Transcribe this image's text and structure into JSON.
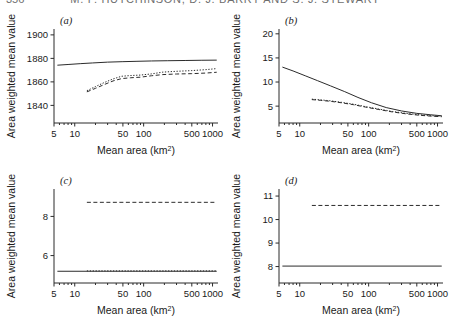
{
  "header": {
    "folio": "356",
    "running_title": "M. F. HUTCHINSON, D. J. BARRY AND S. J. STEWART"
  },
  "axis_titles": {
    "x": "Mean area (km",
    "x_sup": "2",
    "x_close": ")",
    "y": "Area weighted mean value"
  },
  "chart_data": [
    {
      "type": "line",
      "panel": "a",
      "label": "(a)",
      "title": "",
      "xlabel": "Mean area (km2)",
      "ylabel": "Area weighted mean value",
      "xscale": "log",
      "xlim": [
        5,
        1200
      ],
      "ylim": [
        1825,
        1905
      ],
      "xticks": [
        5,
        10,
        50,
        100,
        500,
        1000
      ],
      "xticklabels": [
        "5",
        "10",
        "50",
        "100",
        "500",
        "1000"
      ],
      "yticks": [
        1840,
        1860,
        1880,
        1900
      ],
      "yticklabels": [
        "1840",
        "1860",
        "1880",
        "1900"
      ],
      "grid": false,
      "legend": "none",
      "series": [
        {
          "name": "solid-upper",
          "style": "solid",
          "x": [
            5.6,
            8,
            12,
            18,
            30,
            50,
            80,
            130,
            220,
            400,
            700,
            1150
          ],
          "values": [
            1874.2,
            1874.8,
            1875.5,
            1876.1,
            1876.8,
            1877.2,
            1877.5,
            1877.8,
            1878.0,
            1878.2,
            1878.4,
            1878.5
          ]
        },
        {
          "name": "dotted-middle",
          "style": "dotted",
          "x": [
            15,
            20,
            27,
            36,
            48,
            65,
            90,
            130,
            190,
            300,
            500,
            800,
            1150
          ],
          "values": [
            1852.5,
            1856.0,
            1859.5,
            1862.5,
            1864.8,
            1865.4,
            1865.8,
            1866.8,
            1868.3,
            1869.0,
            1869.6,
            1870.4,
            1871.3
          ]
        },
        {
          "name": "dashed-lower",
          "style": "dashed",
          "x": [
            15,
            20,
            27,
            36,
            48,
            65,
            90,
            130,
            190,
            300,
            500,
            800,
            1150
          ],
          "values": [
            1851.5,
            1854.5,
            1857.8,
            1860.8,
            1862.8,
            1863.5,
            1864.0,
            1865.2,
            1866.2,
            1866.7,
            1867.0,
            1867.5,
            1868.2
          ]
        }
      ]
    },
    {
      "type": "line",
      "panel": "b",
      "label": "(b)",
      "title": "",
      "xlabel": "Mean area (km2)",
      "ylabel": "Area weighted mean value",
      "xscale": "log",
      "xlim": [
        5,
        1200
      ],
      "ylim": [
        1.5,
        21
      ],
      "xticks": [
        5,
        10,
        50,
        100,
        500,
        1000
      ],
      "xticklabels": [
        "5",
        "10",
        "50",
        "100",
        "500",
        "1000"
      ],
      "yticks": [
        5,
        10,
        15,
        20
      ],
      "yticklabels": [
        "5",
        "10",
        "15",
        "20"
      ],
      "grid": false,
      "legend": "none",
      "series": [
        {
          "name": "solid-upper",
          "style": "solid",
          "x": [
            5.6,
            8,
            12,
            18,
            28,
            45,
            70,
            110,
            180,
            300,
            500,
            800,
            1150
          ],
          "values": [
            13.1,
            12.3,
            11.3,
            10.3,
            9.2,
            8.0,
            6.8,
            5.7,
            4.7,
            4.0,
            3.5,
            3.2,
            3.0
          ]
        },
        {
          "name": "dashed-lower",
          "style": "dashed",
          "x": [
            15,
            20,
            28,
            40,
            60,
            90,
            140,
            220,
            350,
            550,
            850,
            1150
          ],
          "values": [
            6.35,
            6.2,
            6.0,
            5.7,
            5.3,
            4.8,
            4.3,
            3.8,
            3.4,
            3.1,
            2.9,
            2.8
          ]
        },
        {
          "name": "dotted-lower",
          "style": "dotted",
          "x": [
            15,
            20,
            28,
            40,
            60,
            90,
            140,
            220,
            350,
            550,
            850,
            1150
          ],
          "values": [
            6.45,
            6.3,
            6.1,
            5.8,
            5.4,
            4.9,
            4.4,
            3.9,
            3.5,
            3.2,
            3.0,
            2.9
          ]
        }
      ]
    },
    {
      "type": "line",
      "panel": "c",
      "label": "(c)",
      "title": "",
      "xlabel": "Mean area (km2)",
      "ylabel": "Area weighted mean value",
      "xscale": "log",
      "xlim": [
        5,
        1200
      ],
      "ylim": [
        4.6,
        9.4
      ],
      "xticks": [
        5,
        10,
        50,
        100,
        500,
        1000
      ],
      "xticklabels": [
        "5",
        "10",
        "50",
        "100",
        "500",
        "1000"
      ],
      "yticks": [
        6,
        8
      ],
      "yticklabels": [
        "6",
        "8"
      ],
      "grid": false,
      "legend": "none",
      "series": [
        {
          "name": "dashed-upper",
          "style": "dashed",
          "x": [
            15,
            1150
          ],
          "values": [
            8.72,
            8.72
          ]
        },
        {
          "name": "solid-lower",
          "style": "solid",
          "x": [
            5.6,
            1150
          ],
          "values": [
            5.2,
            5.2
          ]
        },
        {
          "name": "dotted-lower",
          "style": "dotted",
          "x": [
            15,
            1150
          ],
          "values": [
            5.22,
            5.22
          ]
        }
      ]
    },
    {
      "type": "line",
      "panel": "d",
      "label": "(d)",
      "title": "",
      "xlabel": "Mean area (km2)",
      "ylabel": "Area weighted mean value",
      "xscale": "log",
      "xlim": [
        5,
        1200
      ],
      "ylim": [
        7.3,
        11.3
      ],
      "xticks": [
        5,
        10,
        50,
        100,
        500,
        1000
      ],
      "xticklabels": [
        "5",
        "10",
        "50",
        "100",
        "500",
        "1000"
      ],
      "yticks": [
        8,
        9,
        10,
        11
      ],
      "yticklabels": [
        "8",
        "9",
        "10",
        "11"
      ],
      "grid": false,
      "legend": "none",
      "series": [
        {
          "name": "dashed-upper",
          "style": "dashed",
          "x": [
            15,
            1150
          ],
          "values": [
            10.6,
            10.6
          ]
        },
        {
          "name": "solid-lower",
          "style": "solid",
          "x": [
            5.6,
            1150
          ],
          "values": [
            8.02,
            8.02
          ]
        }
      ]
    }
  ]
}
